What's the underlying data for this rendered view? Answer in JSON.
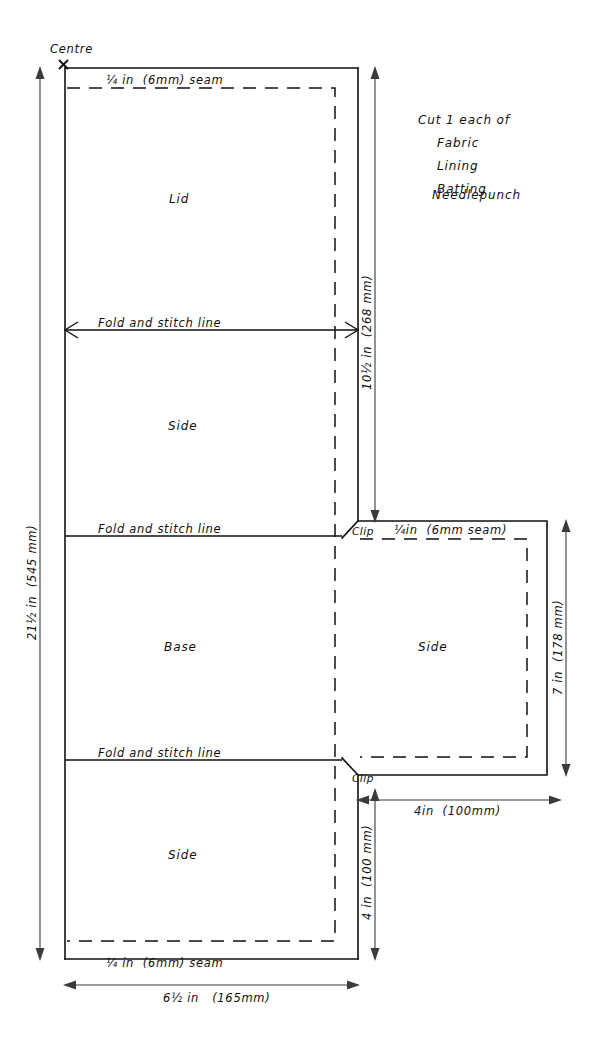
{
  "diagram": {
    "centre_label": "Centre",
    "colors": {
      "cut_line": "#111111",
      "seam_line": "#111111",
      "dimension_line": "#3a3a3a",
      "background": "#ffffff",
      "text": "#101010"
    },
    "panels": [
      {
        "id": "lid",
        "label": "Lid"
      },
      {
        "id": "side-upper",
        "label": "Side"
      },
      {
        "id": "base",
        "label": "Base"
      },
      {
        "id": "side-right",
        "label": "Side"
      },
      {
        "id": "side-lower",
        "label": "Side"
      }
    ],
    "seam_labels": {
      "top": "¼ in  (6mm) seam",
      "bottom": "¼ in  (6mm) seam",
      "right_panel": "¼in  (6mm seam)"
    },
    "fold_labels": {
      "lid_to_side": "Fold and stitch line",
      "side_to_base": "Fold and stitch line",
      "base_to_side": "Fold and stitch line"
    },
    "clip_labels": {
      "upper": "Clip",
      "lower": "Clip"
    },
    "cut_note": {
      "heading": "Cut 1 each of",
      "materials": [
        "Fabric",
        "Lining",
        "Batting",
        "Needlepunch"
      ]
    },
    "dimensions": [
      {
        "id": "overall-height",
        "label": "21½ in  (545 mm)",
        "orientation": "vertical",
        "position": "left"
      },
      {
        "id": "lid-plus-side-height",
        "label": "10½ in  (268 mm)",
        "orientation": "vertical",
        "position": "centre-right"
      },
      {
        "id": "right-panel-height",
        "label": "7 in  (178 mm)",
        "orientation": "vertical",
        "position": "far-right"
      },
      {
        "id": "lower-side-height",
        "label": "4 in  (100 mm)",
        "orientation": "vertical",
        "position": "centre-right-lower"
      },
      {
        "id": "right-panel-width",
        "label": "4in  (100mm)",
        "orientation": "horizontal",
        "position": "right-below"
      },
      {
        "id": "overall-width",
        "label": "6½ in   (165mm)",
        "orientation": "horizontal",
        "position": "bottom"
      }
    ]
  }
}
